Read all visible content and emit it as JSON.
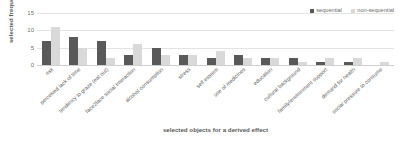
{
  "chart_data": {
    "type": "bar",
    "title": "",
    "xlabel": "selected objects for a derived effect",
    "ylabel": "selected  frequency",
    "ylim": [
      0,
      15
    ],
    "yticks": [
      0,
      5,
      10,
      15
    ],
    "grid": true,
    "legend_position": "top-right",
    "categories": [
      "risk",
      "perceived lack of time",
      "tendency to graze (eat out)",
      "face2face social interaction",
      "alcohol consumption",
      "stress",
      "self esteem",
      "use of medicines",
      "education",
      "cultural background",
      "family/environment support",
      "demand for health",
      "social pressure to consume"
    ],
    "series": [
      {
        "name": "sequential",
        "color": "#595959",
        "values": [
          7,
          8,
          7,
          3,
          5,
          3,
          2,
          3,
          2,
          2,
          1,
          1,
          0
        ]
      },
      {
        "name": "non-sequential",
        "color": "#d9d9d9",
        "values": [
          11,
          5,
          2,
          6,
          3,
          3,
          4,
          2,
          2,
          1,
          2,
          2,
          1
        ]
      }
    ]
  },
  "legend": {
    "entries": [
      {
        "label": "sequential",
        "color": "#595959"
      },
      {
        "label": "non-sequential",
        "color": "#d9d9d9"
      }
    ]
  },
  "axes": {
    "y_title": "selected  frequency",
    "x_title": "selected objects for a derived effect",
    "y_tick_labels": [
      "0",
      "5",
      "10",
      "15"
    ]
  },
  "colors": {
    "sequential": "#595959",
    "non_sequential": "#d9d9d9",
    "gridline": "#e3e3e3",
    "text": "#595959",
    "background": "#ffffff"
  }
}
